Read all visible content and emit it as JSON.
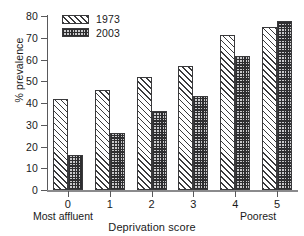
{
  "chart_data": {
    "type": "bar",
    "title": "",
    "subtitle": "",
    "xlabel": "Deprivation score",
    "ylabel": "% prevalence",
    "categories": [
      "0",
      "1",
      "2",
      "3",
      "4",
      "5"
    ],
    "series": [
      {
        "name": "1973",
        "values": [
          42,
          46,
          52,
          57,
          71.5,
          75
        ]
      },
      {
        "name": "2003",
        "values": [
          16,
          26,
          36.5,
          43,
          61.5,
          77.5
        ]
      }
    ],
    "ylim": [
      0,
      80
    ],
    "yticks": [
      0,
      10,
      20,
      30,
      40,
      50,
      60,
      70,
      80
    ],
    "ytick_labels": [
      "0",
      "10",
      "20",
      "30",
      "40",
      "50",
      "60",
      "70",
      "80"
    ],
    "grid": false,
    "legend_position": "top-left",
    "legend_entries": [
      "1973",
      "2003"
    ],
    "annotations": {
      "left_endpoint": "Most affluent",
      "right_endpoint": "Poorest"
    },
    "colors": {
      "series_1973_fill": "#ffffff",
      "series_1973_hatch": "#3a3a3c",
      "series_2003_fill": "#6f6f72",
      "series_2003_hatch": "#2e2e30",
      "axis": "#59595b",
      "text": "#1a1a1a"
    }
  }
}
